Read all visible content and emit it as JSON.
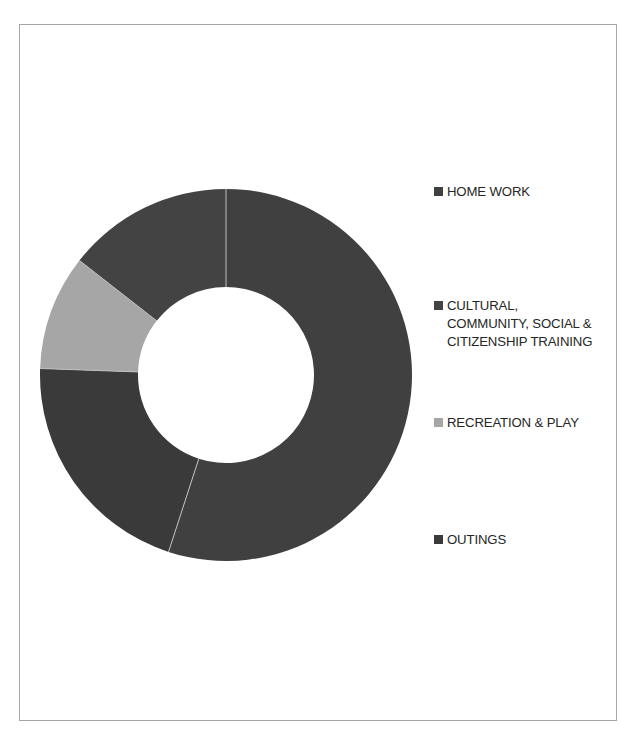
{
  "page": {
    "background_color": "#ffffff",
    "frame_border_color": "#a6a6a6"
  },
  "chart_data": {
    "type": "pie",
    "variant": "donut",
    "title": "",
    "subtitle": "",
    "xlabel": "",
    "ylabel": "",
    "legend_position": "right",
    "grid": false,
    "hole_ratio": 0.47,
    "start_angle_deg": 0,
    "direction": "clockwise",
    "categories": [
      "HOME WORK",
      "CULTURAL, COMMUNITY, SOCIAL & CITIZENSHIP TRAINING",
      "RECREATION & PLAY",
      "OUTINGS"
    ],
    "values": [
      55,
      14.5,
      10,
      20.5
    ],
    "unit": "%",
    "slices": [
      {
        "label": "HOME WORK",
        "value": 55,
        "color": "#404040",
        "start_deg": 0,
        "end_deg": 198
      },
      {
        "label": "OUTINGS",
        "value": 20.5,
        "color": "#3a3a3a",
        "start_deg": 198,
        "end_deg": 272
      },
      {
        "label": "RECREATION & PLAY",
        "value": 10,
        "color": "#a6a6a6",
        "start_deg": 272,
        "end_deg": 308
      },
      {
        "label": "CULTURAL, COMMUNITY, SOCIAL & CITIZENSHIP TRAINING",
        "value": 14.5,
        "color": "#434343",
        "start_deg": 308,
        "end_deg": 360
      }
    ]
  },
  "legend": {
    "items": [
      {
        "label": "HOME WORK",
        "color": "#404040",
        "top": 22,
        "lines": 1
      },
      {
        "label": "CULTURAL, COMMUNITY, SOCIAL & CITIZENSHIP TRAINING",
        "color": "#434343",
        "top": 136,
        "lines": 3
      },
      {
        "label": "RECREATION & PLAY",
        "color": "#a6a6a6",
        "top": 253,
        "lines": 1
      },
      {
        "label": "OUTINGS",
        "color": "#3a3a3a",
        "top": 370,
        "lines": 1
      }
    ]
  },
  "donut": {
    "center_x": 226,
    "center_y": 375,
    "outer_radius": 186,
    "inner_radius": 88,
    "separator_color": "#bfbfbf"
  }
}
